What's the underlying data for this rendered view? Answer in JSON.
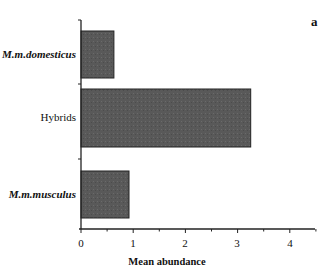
{
  "chart_data": {
    "type": "bar",
    "orientation": "horizontal",
    "panel_label": "a",
    "title": "",
    "categories": [
      "M.m.domesticus",
      "Hybrids",
      "M.m.musculus"
    ],
    "values": [
      0.63,
      3.25,
      0.92
    ],
    "xlabel": "Mean abundance",
    "ylabel": "",
    "xlim": [
      0,
      4.5
    ],
    "xticks": [
      "0",
      "1",
      "2",
      "3",
      "4"
    ],
    "grid": false,
    "legend": null,
    "bar_color": "#5a5a5a"
  }
}
